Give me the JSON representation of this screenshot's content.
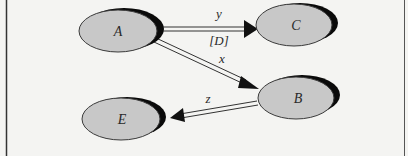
{
  "diagram": {
    "nodes": [
      {
        "id": "A",
        "label": "A",
        "cx": 120,
        "cy": 31,
        "rx": 40,
        "ry": 21
      },
      {
        "id": "C",
        "label": "C",
        "cx": 296,
        "cy": 25,
        "rx": 40,
        "ry": 21
      },
      {
        "id": "B",
        "label": "B",
        "cx": 298,
        "cy": 97,
        "rx": 40,
        "ry": 21
      },
      {
        "id": "E",
        "label": "E",
        "cx": 123,
        "cy": 118,
        "rx": 41,
        "ry": 21
      }
    ],
    "edges": [
      {
        "from": "A",
        "to": "C",
        "label": "y",
        "sublabel": "[D]"
      },
      {
        "from": "A",
        "to": "B",
        "label": "x"
      },
      {
        "from": "B",
        "to": "E",
        "label": "z"
      }
    ],
    "colors": {
      "node_fill": "#c8c8c8",
      "node_stroke": "#3a3a3a",
      "shadow": "#0a0a0a",
      "edge": "#333333",
      "background": "#f4f4f2",
      "border": "#333333"
    }
  }
}
